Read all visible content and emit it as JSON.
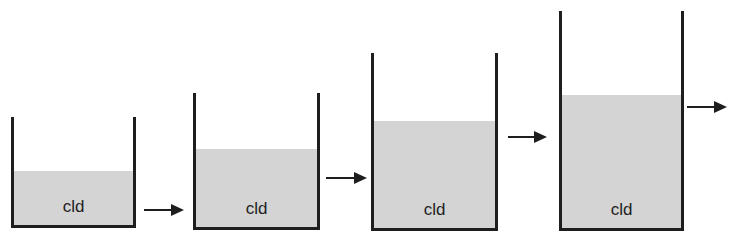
{
  "diagram": {
    "colors": {
      "stroke": "#1e1e1e",
      "fill": "#d4d4d4",
      "background": "#ffffff"
    },
    "containers": [
      {
        "label": "cld",
        "x": 11,
        "top": 117,
        "width": 125,
        "height": 111,
        "fill_height": 54
      },
      {
        "label": "cld",
        "x": 193,
        "top": 93,
        "width": 127,
        "height": 137,
        "fill_height": 78
      },
      {
        "label": "cld",
        "x": 371,
        "top": 53,
        "width": 127,
        "height": 178,
        "fill_height": 107
      },
      {
        "label": "cld",
        "x": 559,
        "top": 11,
        "width": 125,
        "height": 220,
        "fill_height": 133
      }
    ],
    "arrows": [
      {
        "x": 144,
        "y": 204,
        "length": 40
      },
      {
        "x": 326,
        "y": 172,
        "length": 41
      },
      {
        "x": 508,
        "y": 131,
        "length": 39
      },
      {
        "x": 687,
        "y": 101,
        "length": 40
      }
    ]
  }
}
